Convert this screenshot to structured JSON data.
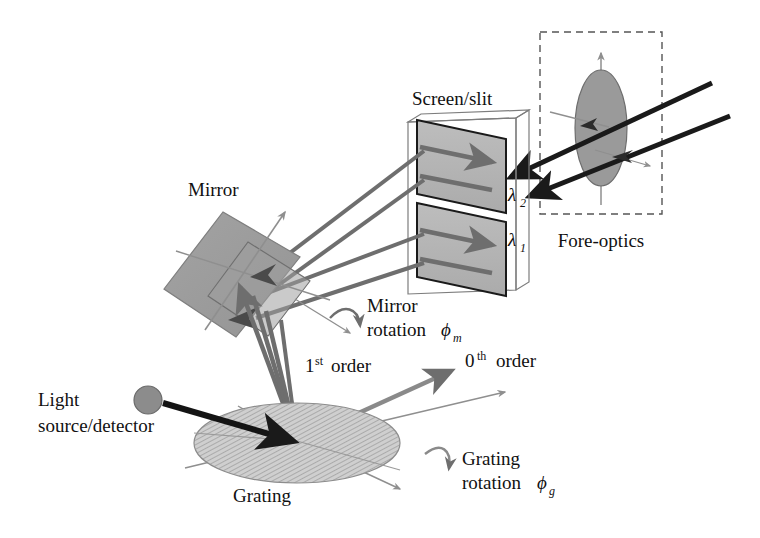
{
  "figure": {
    "background_color": "#ffffff",
    "labels": {
      "screen_slit": "Screen/slit",
      "mirror": "Mirror",
      "fore_optics": "Fore-optics",
      "grating": "Grating",
      "light_source": "Light",
      "light_source_2": "source/detector",
      "mirror_rotation_1": "Mirror",
      "mirror_rotation_2": "rotation",
      "mirror_rotation_symbol": "ϕ",
      "mirror_rotation_subscript": "m",
      "grating_rotation_1": "Grating",
      "grating_rotation_2": "rotation",
      "grating_rotation_symbol": "ϕ",
      "grating_rotation_subscript": "g",
      "order_first_num": "1",
      "order_first_sup": "st",
      "order_first_word": "order",
      "order_zero_num": "0",
      "order_zero_sup": "th",
      "order_zero_word": "order",
      "lambda_2_symbol": "λ",
      "lambda_2_subscript": "2",
      "lambda_1_symbol": "λ",
      "lambda_1_subscript": "1"
    },
    "colors": {
      "stroke_dark": "#1a1a1a",
      "ray_gray": "#6e6e6e",
      "axis_gray": "#8f8f8f",
      "mirror_fill": "#9b9b9b",
      "screen_fill": "#b4b4b4",
      "grating_fill": "#c4c4c4",
      "lens_fill": "#9a9a9a",
      "source_fill": "#8c8c8c",
      "dashed_box": "#555555"
    },
    "components": [
      {
        "name": "light-source-detector",
        "label": "Light source/detector",
        "shape": "circle"
      },
      {
        "name": "grating",
        "label": "Grating",
        "shape": "hatched-ellipse",
        "rotation": "ϕg"
      },
      {
        "name": "mirror",
        "label": "Mirror",
        "shape": "tilted-square",
        "rotation": "ϕm"
      },
      {
        "name": "screen-slit",
        "label": "Screen/slit",
        "shape": "two-parallelogram-panels",
        "wavelengths": [
          "λ1",
          "λ2"
        ]
      },
      {
        "name": "fore-optics",
        "label": "Fore-optics",
        "shape": "dashed-box-with-lens"
      }
    ],
    "beams": [
      {
        "name": "source-to-grating",
        "style": "thick-black-arrow"
      },
      {
        "name": "first-order-fan",
        "style": "gray-rays",
        "label": "1st order"
      },
      {
        "name": "zero-order",
        "style": "gray-arrow",
        "label": "0th order"
      },
      {
        "name": "mirror-to-screen-lambda2",
        "style": "gray-double-ray"
      },
      {
        "name": "mirror-to-screen-lambda1",
        "style": "gray-double-ray"
      },
      {
        "name": "fore-optics-beam-upper",
        "style": "thick-black-arrow"
      },
      {
        "name": "fore-optics-beam-lower",
        "style": "thick-black-arrow"
      }
    ]
  }
}
